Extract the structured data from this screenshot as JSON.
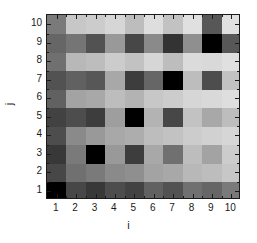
{
  "chart_data": {
    "type": "heatmap",
    "title": "",
    "xlabel": "i",
    "ylabel": "j",
    "x": [
      1,
      2,
      3,
      4,
      5,
      6,
      7,
      8,
      9,
      10
    ],
    "y": [
      1,
      2,
      3,
      4,
      5,
      6,
      7,
      8,
      9,
      10
    ],
    "xlim": [
      0.5,
      10.5
    ],
    "ylim": [
      0.5,
      10.5
    ],
    "xtick_labels": [
      "1",
      "2",
      "3",
      "4",
      "5",
      "6",
      "7",
      "8",
      "9",
      "10"
    ],
    "ytick_labels": [
      "1",
      "2",
      "3",
      "4",
      "5",
      "6",
      "7",
      "8",
      "9",
      "10"
    ],
    "grid": false,
    "legend": "none",
    "colormap": "gray-reversed",
    "value_range": [
      0,
      1
    ],
    "colorbar": false,
    "rows_order": "bottom-to-top",
    "values": [
      [
        1.0,
        0.72,
        0.78,
        0.7,
        0.74,
        0.62,
        0.68,
        0.56,
        0.6,
        0.52
      ],
      [
        0.72,
        0.56,
        0.52,
        0.46,
        0.44,
        0.36,
        0.34,
        0.28,
        0.26,
        0.22
      ],
      [
        0.78,
        0.52,
        1.0,
        0.4,
        0.76,
        0.34,
        0.56,
        0.26,
        0.36,
        0.2
      ],
      [
        0.7,
        0.46,
        0.4,
        0.34,
        0.32,
        0.26,
        0.24,
        0.2,
        0.18,
        0.16
      ],
      [
        0.74,
        0.7,
        0.76,
        0.38,
        1.0,
        0.3,
        0.72,
        0.24,
        0.34,
        0.26
      ],
      [
        0.62,
        0.36,
        0.34,
        0.26,
        0.3,
        0.22,
        0.2,
        0.16,
        0.15,
        0.13
      ],
      [
        0.68,
        0.62,
        0.66,
        0.34,
        0.76,
        0.6,
        1.0,
        0.26,
        0.7,
        0.24
      ],
      [
        0.56,
        0.28,
        0.26,
        0.2,
        0.24,
        0.16,
        0.26,
        0.14,
        0.15,
        0.12
      ],
      [
        0.6,
        0.54,
        0.68,
        0.4,
        0.72,
        0.46,
        0.8,
        0.44,
        1.0,
        0.66
      ],
      [
        0.52,
        0.22,
        0.2,
        0.16,
        0.26,
        0.13,
        0.24,
        0.12,
        0.66,
        0.12
      ]
    ]
  },
  "axes": {
    "x_title": "i",
    "y_title": "j"
  }
}
